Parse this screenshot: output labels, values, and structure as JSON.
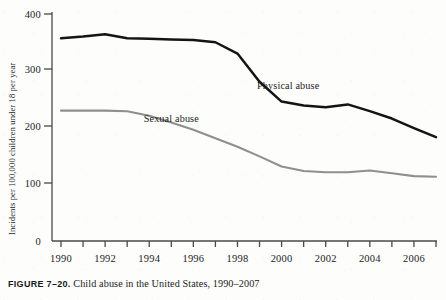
{
  "figure": {
    "number_label": "FIGURE 7–20.",
    "caption_text": " Child abuse in the United States, 1990–2007"
  },
  "chart_data": {
    "type": "line",
    "title": "",
    "xlabel": "",
    "ylabel": "Incidents per 100,000 children under 18 per year",
    "x": [
      1990,
      1991,
      1992,
      1993,
      1994,
      1995,
      1996,
      1997,
      1998,
      1999,
      2000,
      2001,
      2002,
      2003,
      2004,
      2005,
      2006,
      2007
    ],
    "xlim": [
      1990,
      2007
    ],
    "ylim": [
      0,
      400
    ],
    "grid": false,
    "legend_position": "inline-annotations",
    "x_tick_labels": [
      "1990",
      "",
      "1992",
      "",
      "1994",
      "",
      "1996",
      "",
      "1998",
      "",
      "2000",
      "",
      "2002",
      "",
      "2004",
      "",
      "2006",
      ""
    ],
    "y_ticks": [
      0,
      100,
      200,
      300,
      400
    ],
    "y_tick_labels": [
      "0",
      "100",
      "200",
      "300",
      "400"
    ],
    "series": [
      {
        "name": "Physical abuse",
        "color": "#141414",
        "values": [
          357,
          360,
          364,
          357,
          356,
          355,
          354,
          350,
          330,
          280,
          245,
          238,
          235,
          240,
          228,
          215,
          198,
          182
        ]
      },
      {
        "name": "Sexual abuse",
        "color": "#8f8f8f",
        "values": [
          229,
          229,
          229,
          228,
          220,
          208,
          195,
          180,
          165,
          148,
          130,
          122,
          120,
          120,
          123,
          118,
          113,
          112
        ]
      }
    ],
    "annotations": [
      {
        "text": "Physical abuse",
        "x": 2000.3,
        "y": 268
      },
      {
        "text": "Sexual abuse",
        "x": 1995.0,
        "y": 208
      }
    ]
  }
}
